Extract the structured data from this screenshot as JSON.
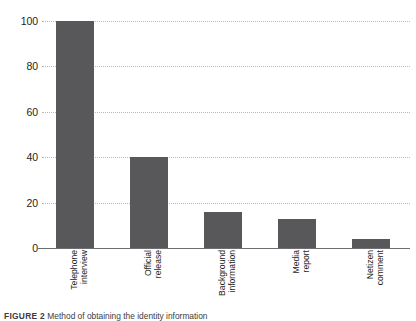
{
  "chart_data": {
    "type": "bar",
    "title": "",
    "xlabel": "",
    "ylabel": "",
    "categories": [
      "Telephone interview",
      "Official release",
      "Background information",
      "Media report",
      "Netizen comment"
    ],
    "category_lines": [
      [
        "Telephone",
        "interview"
      ],
      [
        "Official",
        "release"
      ],
      [
        "Background",
        "information"
      ],
      [
        "Media",
        "report"
      ],
      [
        "Netizen",
        "comment"
      ]
    ],
    "values": [
      100,
      40,
      16,
      13,
      4
    ],
    "ylim": [
      0,
      100
    ],
    "yticks": [
      0,
      20,
      40,
      60,
      80,
      100
    ],
    "ytick_labels": [
      "0",
      "20",
      "40",
      "60",
      "80",
      "100"
    ],
    "grid": true,
    "grid_style": "dotted",
    "legend": "none",
    "bar_color": "#58585a",
    "grid_color": "#b8b8ba",
    "axis_color": "#6d6e70"
  },
  "caption": {
    "figure_number": "FIGURE 2",
    "text": "Method of obtaining the identity information"
  }
}
